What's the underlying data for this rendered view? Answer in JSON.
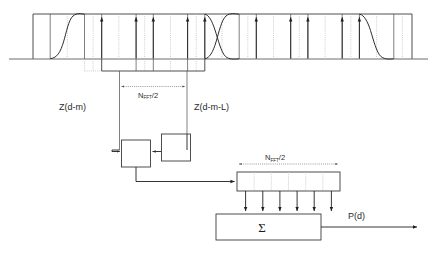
{
  "figure": {
    "title_text": "",
    "labels": {
      "z_left": "Z(d-m)",
      "z_right": "Z(d-m-L)",
      "nfft_top_main": "N",
      "nfft_top_sub": "FFT",
      "nfft_top_tail": "/2",
      "nfft_bottom_main": "N",
      "nfft_bottom_sub": "FFT",
      "nfft_bottom_tail": "/2",
      "sigma": "Σ",
      "output": "P(d)"
    },
    "colors": {
      "stroke_dark": "#3b3b3b",
      "stroke_arrow": "#1f1f1f",
      "stroke_light": "#b9b9b9",
      "baseline": "#6e6e6e",
      "background": "#ffffff",
      "text": "#2b2b2b"
    },
    "waveform": {
      "baseline_y": 59,
      "top_y": 14,
      "left_edge": 33,
      "right_edge": 412,
      "rise_curve_segment": [
        1
      ],
      "fall_rise_crossover_segment": [
        11
      ],
      "fall_curve_segment": [
        21
      ],
      "up_arrow_segments_left": [
        3,
        5,
        7,
        9,
        10
      ],
      "up_arrow_segments_right": [
        14,
        16,
        17,
        19,
        20
      ],
      "segment_count": 22
    },
    "register": {
      "cell_count": 6,
      "down_arrow_count": 6
    },
    "boxes": {
      "left_box_label": "",
      "right_box_label": ""
    }
  }
}
